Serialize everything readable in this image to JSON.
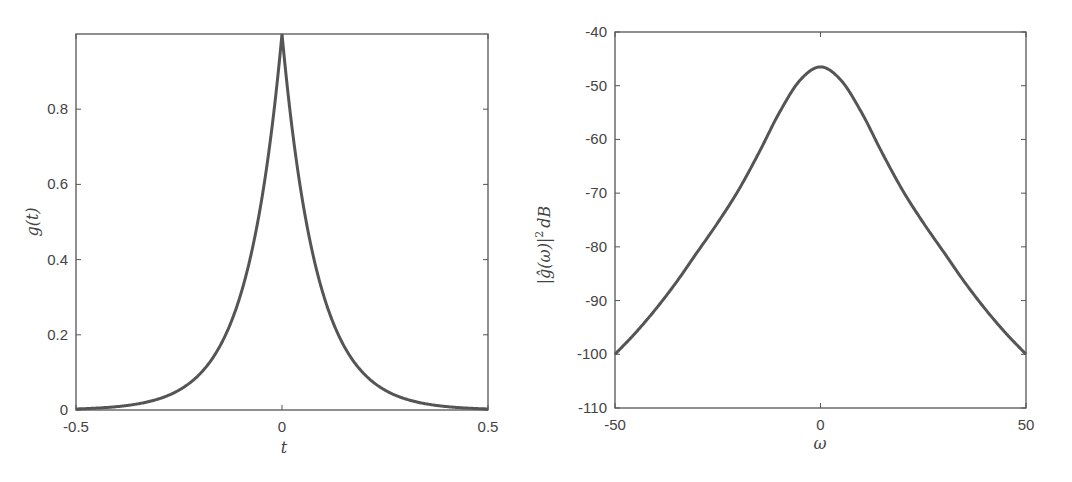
{
  "chart_data": [
    {
      "type": "line",
      "title": "",
      "xlabel": "t",
      "ylabel": "g(t)",
      "xlim": [
        -0.5,
        0.5
      ],
      "ylim": [
        0,
        1
      ],
      "xticks": [
        -0.5,
        0,
        0.5
      ],
      "xtick_labels": [
        "-0.5",
        "0",
        "0.5"
      ],
      "yticks": [
        0,
        0.2,
        0.4,
        0.6,
        0.8
      ],
      "ytick_labels": [
        "0",
        "0.2",
        "0.4",
        "0.6",
        "0.8"
      ],
      "grid": false,
      "legend": null,
      "series": [
        {
          "name": "g(t)",
          "x": [
            -0.5,
            -0.45,
            -0.4,
            -0.35,
            -0.3,
            -0.25,
            -0.2,
            -0.15,
            -0.1,
            -0.05,
            0,
            0.05,
            0.1,
            0.15,
            0.2,
            0.25,
            0.3,
            0.35,
            0.4,
            0.45,
            0.5
          ],
          "values": [
            0.0,
            0.002,
            0.006,
            0.015,
            0.035,
            0.07,
            0.13,
            0.22,
            0.36,
            0.58,
            1.0,
            0.58,
            0.36,
            0.22,
            0.13,
            0.07,
            0.035,
            0.015,
            0.006,
            0.002,
            0.0
          ]
        }
      ]
    },
    {
      "type": "line",
      "title": "",
      "xlabel": "ω",
      "ylabel": "|ĝ(ω)|² dB",
      "xlim": [
        -50,
        50
      ],
      "ylim": [
        -110,
        -40
      ],
      "xticks": [
        -50,
        0,
        50
      ],
      "xtick_labels": [
        "-50",
        "0",
        "50"
      ],
      "yticks": [
        -40,
        -50,
        -60,
        -70,
        -80,
        -90,
        -100,
        -110
      ],
      "ytick_labels": [
        "-40",
        "-50",
        "-60",
        "-70",
        "-80",
        "-90",
        "-100",
        "-110"
      ],
      "grid": false,
      "legend": null,
      "series": [
        {
          "name": "|ĝ(ω)|² dB",
          "x": [
            -50,
            -45,
            -40,
            -35,
            -30,
            -25,
            -20,
            -15,
            -10,
            -5,
            0,
            5,
            10,
            15,
            20,
            25,
            30,
            35,
            40,
            45,
            50
          ],
          "values": [
            -100,
            -96,
            -91.5,
            -86.5,
            -81,
            -75.5,
            -69.5,
            -62.5,
            -55,
            -49,
            -46.5,
            -49,
            -55,
            -62.5,
            -69.5,
            -75.5,
            -81,
            -86.5,
            -91.5,
            -96,
            -100
          ]
        }
      ]
    }
  ],
  "plots": {
    "left": {
      "xlabel": "t",
      "ylabel": "g(t)"
    },
    "right": {
      "xlabel": "ω",
      "ylabel_main": "|ĝ(ω)|",
      "ylabel_sup": "2",
      "ylabel_unit": "dB"
    }
  },
  "colors": {
    "line": "#555555",
    "axes": "#555555",
    "text": "#444444",
    "background": "#ffffff"
  }
}
